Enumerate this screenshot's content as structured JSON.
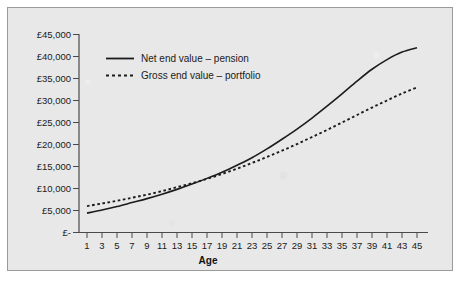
{
  "chart_data": {
    "type": "line",
    "title": "",
    "xlabel": "Age",
    "ylabel": "",
    "xlim": [
      1,
      46
    ],
    "ylim": [
      0,
      45000
    ],
    "grid": false,
    "legend_position": "top-left inside plot",
    "x_tick_labels": [
      "1",
      "3",
      "5",
      "7",
      "9",
      "11",
      "13",
      "15",
      "17",
      "19",
      "21",
      "23",
      "25",
      "27",
      "29",
      "31",
      "33",
      "35",
      "37",
      "39",
      "41",
      "43",
      "45"
    ],
    "y_tick_labels": [
      "£-",
      "£5,000",
      "£10,000",
      "£15,000",
      "£20,000",
      "£25,000",
      "£30,000",
      "£35,000",
      "£40,000",
      "£45,000"
    ],
    "y_tick_values": [
      0,
      5000,
      10000,
      15000,
      20000,
      25000,
      30000,
      35000,
      40000,
      45000
    ],
    "x": [
      1,
      3,
      5,
      7,
      9,
      11,
      13,
      15,
      17,
      19,
      21,
      23,
      25,
      27,
      29,
      31,
      33,
      35,
      37,
      39,
      41,
      43,
      45
    ],
    "series": [
      {
        "name": "Net end value – pension",
        "style": "solid",
        "color": "#1c1c1c",
        "values": [
          4400,
          5100,
          5900,
          6800,
          7700,
          8700,
          9800,
          11000,
          12300,
          13700,
          15300,
          17000,
          19000,
          21200,
          23500,
          26000,
          28700,
          31500,
          34400,
          37100,
          39300,
          41000,
          42000
        ]
      },
      {
        "name": "Gross end value – portfolio",
        "style": "dotted",
        "color": "#1c1c1c",
        "values": [
          6000,
          6600,
          7200,
          7900,
          8600,
          9400,
          10300,
          11200,
          12200,
          13300,
          14500,
          15800,
          17200,
          18600,
          20100,
          21700,
          23300,
          25000,
          26700,
          28400,
          30000,
          31600,
          33000
        ]
      }
    ]
  },
  "legend": {
    "entries": [
      {
        "label": "Net end value – pension"
      },
      {
        "label": "Gross end value – portfolio"
      }
    ]
  },
  "axes": {
    "x_title": "Age"
  },
  "colors": {
    "background": "#e8e8e8",
    "frame": "#9a9a9a",
    "ink": "#1c1c1c",
    "axis": "#4a4a4a"
  }
}
